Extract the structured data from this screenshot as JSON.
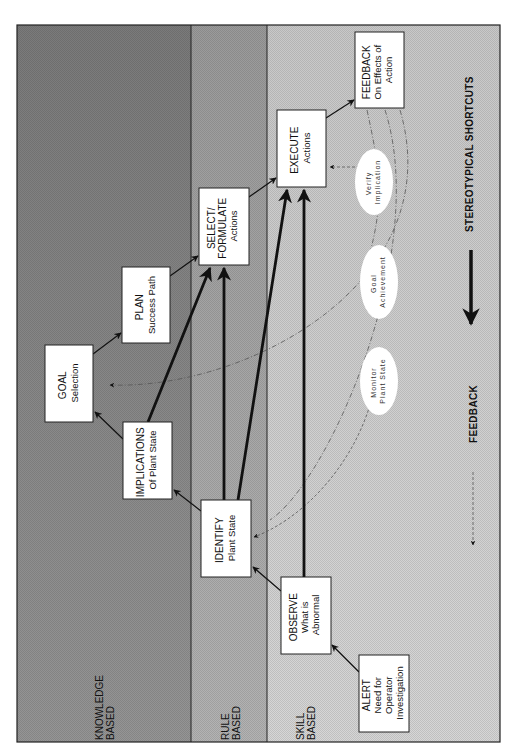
{
  "diagram": {
    "orientation": "rotated-90-ccw",
    "colors": {
      "knowledge_band": "#8c8c8c",
      "rule_band": "#a9a9a9",
      "skill_band": "#cfcfcf",
      "box_fill": "#ffffff",
      "ellipse_fill": "#ffffff",
      "line": "#111111"
    },
    "bands": [
      {
        "id": "knowledge",
        "line1": "KNOWLEDGE",
        "line2": "BASED"
      },
      {
        "id": "rule",
        "line1": "RULE",
        "line2": "BASED"
      },
      {
        "id": "skill",
        "line1": "SKILL",
        "line2": "BASED"
      }
    ],
    "boxes": {
      "alert": {
        "title": "ALERT",
        "lines": [
          "Need for",
          "Operator",
          "Investigation"
        ]
      },
      "observe": {
        "title": "OBSERVE",
        "lines": [
          "What is",
          "Abnormal"
        ]
      },
      "identify": {
        "title": "IDENTIFY",
        "lines": [
          "Plant State"
        ]
      },
      "implications": {
        "title": "IMPLICATIONS",
        "lines": [
          "Of Plant State"
        ]
      },
      "goal": {
        "title": "GOAL",
        "lines": [
          "Selection"
        ]
      },
      "plan": {
        "title": "PLAN",
        "lines": [
          "Success Path"
        ]
      },
      "select": {
        "title": "SELECT/",
        "lines": [
          "FORMULATE",
          "Actions"
        ]
      },
      "execute": {
        "title": "EXECUTE",
        "lines": [
          "Actions"
        ]
      },
      "feedback": {
        "title": "FEEDBACK",
        "lines": [
          "On Effects of",
          "Action"
        ]
      }
    },
    "ellipses": {
      "monitor": {
        "line1": "Monitor",
        "line2": "Plant State"
      },
      "goal_achievement": {
        "line1": "Goal",
        "line2": "Achievement"
      },
      "verify": {
        "line1": "Verify",
        "line2": "Implication"
      }
    },
    "legend": {
      "shortcuts": "STEREOTYPICAL SHORTCUTS",
      "feedback": "FEEDBACK"
    }
  }
}
